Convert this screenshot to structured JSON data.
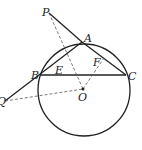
{
  "diagram": {
    "type": "geometry",
    "labels": {
      "P": "P",
      "A": "A",
      "B": "B",
      "C": "C",
      "E": "E",
      "F": "F",
      "O": "O",
      "Q": "Q"
    },
    "points": {
      "P": [
        49,
        13
      ],
      "A": [
        82,
        42
      ],
      "B": [
        40,
        75
      ],
      "C": [
        126,
        75
      ],
      "O": [
        83,
        89
      ],
      "Q": [
        5,
        101
      ]
    },
    "circle": {
      "center": "O",
      "cx": 84,
      "cy": 90,
      "r": 45
    },
    "solid_segments": [
      "PA",
      "AC",
      "BC",
      "QB",
      "BA"
    ],
    "dashed_segments": [
      "PO",
      "QO",
      "OF"
    ],
    "colors": {
      "stroke": "#222222",
      "background": "#ffffff"
    }
  }
}
